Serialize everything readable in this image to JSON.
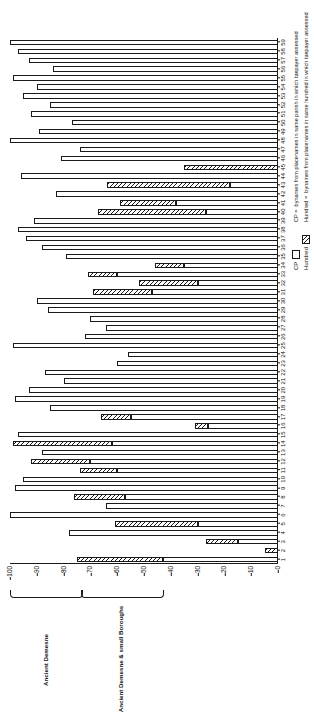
{
  "chart_data": {
    "type": "bar",
    "orientation": "vertical-stacked-rotated",
    "title": "",
    "xlabel": "",
    "ylabel": "",
    "ylim": [
      0,
      100
    ],
    "yticks": [
      0,
      10,
      20,
      30,
      40,
      50,
      60,
      70,
      80,
      90,
      100
    ],
    "grid": false,
    "legend_position": "bottom-right",
    "categories": [
      "1",
      "2",
      "3",
      "4",
      "5",
      "6",
      "7",
      "8",
      "9",
      "10",
      "11",
      "12",
      "13",
      "14",
      "15",
      "16",
      "17",
      "18",
      "19",
      "20",
      "21",
      "22",
      "23",
      "24",
      "25",
      "26",
      "27",
      "28",
      "29",
      "30",
      "31",
      "32",
      "33",
      "34",
      "35",
      "36",
      "37",
      "38",
      "39",
      "40",
      "41",
      "42",
      "43",
      "44",
      "45",
      "46",
      "47",
      "48",
      "49",
      "50",
      "51",
      "52",
      "53",
      "54",
      "55",
      "56",
      "57",
      "58",
      "59"
    ],
    "series": [
      {
        "name": "CP",
        "values": [
          64,
          0,
          30,
          77,
          61,
          89,
          65,
          76,
          0,
          0,
          0,
          0,
          0,
          0,
          77,
          73,
          83,
          0,
          0,
          0,
          0,
          0,
          0,
          0,
          0,
          0,
          0,
          0,
          0,
          0,
          0,
          0,
          0,
          0,
          0,
          0,
          0,
          0,
          0,
          0,
          0,
          0,
          0,
          0,
          0,
          0,
          0,
          0,
          0,
          0,
          0,
          0,
          0,
          0,
          0,
          0,
          0,
          0,
          0
        ]
      },
      {
        "name": "Hundred",
        "values": [
          0,
          5,
          0,
          0,
          0,
          0,
          0,
          0,
          0,
          0,
          0,
          0,
          0,
          0,
          0,
          0,
          0,
          0,
          0,
          0,
          0,
          0,
          0,
          0,
          0,
          0,
          0,
          0,
          0,
          0,
          0,
          0,
          0,
          0,
          0,
          0,
          0,
          0,
          0,
          0,
          0,
          0,
          0,
          0,
          0,
          0,
          0,
          0,
          0,
          0,
          0,
          0,
          0,
          0,
          0,
          0,
          0,
          0,
          0
        ]
      }
    ],
    "bars": [
      {
        "cat": "1",
        "cp": 43,
        "hundred": 32
      },
      {
        "cat": "2",
        "cp": 0,
        "hundred": 5
      },
      {
        "cat": "3",
        "cp": 0,
        "hundred": 27
      },
      {
        "cat": "4",
        "cp": 0,
        "hundred": 0
      },
      {
        "cat": "5",
        "cp": 30,
        "hundred": 31
      },
      {
        "cat": "6",
        "cp": 0,
        "hundred": 0
      },
      {
        "cat": "7",
        "cp": 64,
        "hundred": 0
      },
      {
        "cat": "8",
        "cp": 57,
        "hundred": 19
      },
      {
        "cat": "9",
        "cp": 0,
        "hundred": 0
      },
      {
        "cat": "10",
        "cp": 0,
        "hundred": 0
      },
      {
        "cat": "11",
        "cp": 60,
        "hundred": 14
      },
      {
        "cat": "12",
        "cp": 0,
        "hundred": 22
      },
      {
        "cat": "13",
        "cp": 0,
        "hundred": 0
      },
      {
        "cat": "14",
        "cp": 0,
        "hundred": 37
      },
      {
        "cat": "15",
        "cp": 0,
        "hundred": 0
      },
      {
        "cat": "16",
        "cp": 26,
        "hundred": 5
      },
      {
        "cat": "17",
        "cp": 55,
        "hundred": 11
      },
      {
        "cat": "18",
        "cp": 0,
        "hundred": 0
      },
      {
        "cat": "19",
        "cp": 0,
        "hundred": 0
      },
      {
        "cat": "20",
        "cp": 0,
        "hundred": 0
      },
      {
        "cat": "21",
        "cp": 0,
        "hundred": 0
      },
      {
        "cat": "22",
        "cp": 0,
        "hundred": 0
      },
      {
        "cat": "23",
        "cp": 60,
        "hundred": 0
      },
      {
        "cat": "24",
        "cp": 56,
        "hundred": 0
      },
      {
        "cat": "25",
        "cp": 0,
        "hundred": 0
      },
      {
        "cat": "26",
        "cp": 0,
        "hundred": 0
      },
      {
        "cat": "27",
        "cp": 0,
        "hundred": 0
      },
      {
        "cat": "28",
        "cp": 0,
        "hundred": 0
      },
      {
        "cat": "29",
        "cp": 0,
        "hundred": 0
      },
      {
        "cat": "30",
        "cp": 0,
        "hundred": 0
      },
      {
        "cat": "31",
        "cp": 47,
        "hundred": 22
      },
      {
        "cat": "32",
        "cp": 30,
        "hundred": 22
      },
      {
        "cat": "33",
        "cp": 60,
        "hundred": 11
      },
      {
        "cat": "34",
        "cp": 0,
        "hundred": 11
      },
      {
        "cat": "35",
        "cp": 0,
        "hundred": 0
      },
      {
        "cat": "36",
        "cp": 0,
        "hundred": 0
      },
      {
        "cat": "37",
        "cp": 0,
        "hundred": 0
      },
      {
        "cat": "38",
        "cp": 0,
        "hundred": 0
      },
      {
        "cat": "39",
        "cp": 0,
        "hundred": 0
      },
      {
        "cat": "40",
        "cp": 27,
        "hundred": 40
      },
      {
        "cat": "41",
        "cp": 38,
        "hundred": 21
      },
      {
        "cat": "42",
        "cp": 0,
        "hundred": 0
      },
      {
        "cat": "43",
        "cp": 18,
        "hundred": 46
      },
      {
        "cat": "44",
        "cp": 0,
        "hundred": 0
      },
      {
        "cat": "45",
        "cp": 0,
        "hundred": 35
      },
      {
        "cat": "46",
        "cp": 0,
        "hundred": 0
      },
      {
        "cat": "47",
        "cp": 0,
        "hundred": 0
      },
      {
        "cat": "48",
        "cp": 0,
        "hundred": 0
      },
      {
        "cat": "49",
        "cp": 0,
        "hundred": 0
      },
      {
        "cat": "50",
        "cp": 0,
        "hundred": 0
      },
      {
        "cat": "51",
        "cp": 0,
        "hundred": 0
      },
      {
        "cat": "52",
        "cp": 0,
        "hundred": 0
      },
      {
        "cat": "53",
        "cp": 0,
        "hundred": 0
      },
      {
        "cat": "54",
        "cp": 0,
        "hundred": 0
      },
      {
        "cat": "55",
        "cp": 0,
        "hundred": 0
      },
      {
        "cat": "56",
        "cp": 0,
        "hundred": 0
      },
      {
        "cat": "57",
        "cp": 0,
        "hundred": 0
      },
      {
        "cat": "58",
        "cp": 0,
        "hundred": 0
      },
      {
        "cat": "59",
        "cp": 0,
        "hundred": 0
      }
    ],
    "bar_layout": [
      {
        "cat": "1",
        "total": 75,
        "hatch": 32
      },
      {
        "cat": "2",
        "total": 5,
        "hatch": 5
      },
      {
        "cat": "3",
        "total": 27,
        "hatch": 12
      },
      {
        "cat": "4",
        "total": 78,
        "hatch": 0
      },
      {
        "cat": "5",
        "total": 61,
        "hatch": 31
      },
      {
        "cat": "6",
        "total": 100,
        "hatch": 0
      },
      {
        "cat": "7",
        "total": 64,
        "hatch": 0
      },
      {
        "cat": "8",
        "total": 76,
        "hatch": 19
      },
      {
        "cat": "9",
        "total": 98,
        "hatch": 0
      },
      {
        "cat": "10",
        "total": 95,
        "hatch": 0
      },
      {
        "cat": "11",
        "total": 74,
        "hatch": 14
      },
      {
        "cat": "12",
        "total": 92,
        "hatch": 22
      },
      {
        "cat": "13",
        "total": 88,
        "hatch": 0
      },
      {
        "cat": "14",
        "total": 99,
        "hatch": 37
      },
      {
        "cat": "15",
        "total": 97,
        "hatch": 0
      },
      {
        "cat": "16",
        "total": 31,
        "hatch": 5
      },
      {
        "cat": "17",
        "total": 66,
        "hatch": 11
      },
      {
        "cat": "18",
        "total": 85,
        "hatch": 0
      },
      {
        "cat": "19",
        "total": 98,
        "hatch": 0
      },
      {
        "cat": "20",
        "total": 93,
        "hatch": 0
      },
      {
        "cat": "21",
        "total": 80,
        "hatch": 0
      },
      {
        "cat": "22",
        "total": 87,
        "hatch": 0
      },
      {
        "cat": "23",
        "total": 60,
        "hatch": 0
      },
      {
        "cat": "24",
        "total": 56,
        "hatch": 0
      },
      {
        "cat": "25",
        "total": 99,
        "hatch": 0
      },
      {
        "cat": "26",
        "total": 72,
        "hatch": 0
      },
      {
        "cat": "27",
        "total": 64,
        "hatch": 0
      },
      {
        "cat": "28",
        "total": 70,
        "hatch": 0
      },
      {
        "cat": "29",
        "total": 86,
        "hatch": 0
      },
      {
        "cat": "30",
        "total": 90,
        "hatch": 0
      },
      {
        "cat": "31",
        "total": 69,
        "hatch": 22
      },
      {
        "cat": "32",
        "total": 52,
        "hatch": 22
      },
      {
        "cat": "33",
        "total": 71,
        "hatch": 11
      },
      {
        "cat": "34",
        "total": 46,
        "hatch": 11
      },
      {
        "cat": "35",
        "total": 79,
        "hatch": 0
      },
      {
        "cat": "36",
        "total": 88,
        "hatch": 0
      },
      {
        "cat": "37",
        "total": 94,
        "hatch": 0
      },
      {
        "cat": "38",
        "total": 97,
        "hatch": 0
      },
      {
        "cat": "39",
        "total": 91,
        "hatch": 0
      },
      {
        "cat": "40",
        "total": 67,
        "hatch": 40
      },
      {
        "cat": "41",
        "total": 59,
        "hatch": 21
      },
      {
        "cat": "42",
        "total": 83,
        "hatch": 0
      },
      {
        "cat": "43",
        "total": 64,
        "hatch": 46
      },
      {
        "cat": "44",
        "total": 96,
        "hatch": 0
      },
      {
        "cat": "45",
        "total": 35,
        "hatch": 35
      },
      {
        "cat": "46",
        "total": 81,
        "hatch": 0
      },
      {
        "cat": "47",
        "total": 74,
        "hatch": 0
      },
      {
        "cat": "48",
        "total": 100,
        "hatch": 0
      },
      {
        "cat": "49",
        "total": 89,
        "hatch": 0
      },
      {
        "cat": "50",
        "total": 77,
        "hatch": 0
      },
      {
        "cat": "51",
        "total": 92,
        "hatch": 0
      },
      {
        "cat": "52",
        "total": 85,
        "hatch": 0
      },
      {
        "cat": "53",
        "total": 95,
        "hatch": 0
      },
      {
        "cat": "54",
        "total": 90,
        "hatch": 0
      },
      {
        "cat": "55",
        "total": 99,
        "hatch": 0
      },
      {
        "cat": "56",
        "total": 84,
        "hatch": 0
      },
      {
        "cat": "57",
        "total": 93,
        "hatch": 0
      },
      {
        "cat": "58",
        "total": 97,
        "hatch": 0
      },
      {
        "cat": "59",
        "total": 100,
        "hatch": 0
      }
    ]
  },
  "axis": {
    "value_ticks": [
      "100",
      "90",
      "80",
      "70",
      "60",
      "50",
      "40",
      "30",
      "20",
      "10",
      "0"
    ],
    "value_max": 100,
    "value_min": 0
  },
  "groups": [
    {
      "id": "ancient-demesne",
      "label": "Ancient Demesne",
      "from": 1,
      "to": 8
    },
    {
      "id": "ancient-demesne-small-boroughs",
      "label": "Ancient Demesne & small Boroughs",
      "from": 9,
      "to": 17
    }
  ],
  "legend": {
    "keys": [
      {
        "id": "cp",
        "name": "CP",
        "fill": "white"
      },
      {
        "id": "hundred",
        "name": "Hundred",
        "fill": "hatched"
      }
    ],
    "descriptions": [
      {
        "key": "CP  =",
        "text": "bynames from placenames in same parish in which taxpayer assessed"
      },
      {
        "key": "Hundred =",
        "text": "bynames from placenames in same hundred in which taxpayer assessed"
      }
    ]
  },
  "colors": {
    "ink": "#1a1a1a",
    "paper": "#ffffff"
  }
}
